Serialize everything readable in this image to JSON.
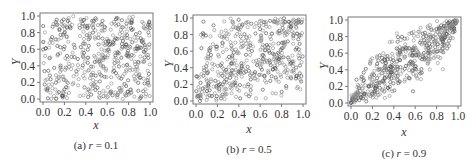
{
  "figure": {
    "panels": [
      {
        "id": "a",
        "caption_prefix": "(a) ",
        "caption_var": "r",
        "caption_eq": " = 0.1"
      },
      {
        "id": "b",
        "caption_prefix": "(b) ",
        "caption_var": "r",
        "caption_eq": " = 0.5"
      },
      {
        "id": "c",
        "caption_prefix": "(c) ",
        "caption_var": "r",
        "caption_eq": " = 0.9"
      }
    ]
  },
  "chart_data": [
    {
      "type": "scatter",
      "title": "(a) r = 0.1",
      "xlabel": "x",
      "ylabel": "Y",
      "xlim": [
        0.0,
        1.0
      ],
      "ylim": [
        0.0,
        1.0
      ],
      "xticks": [
        "0.0",
        "0.2",
        "0.4",
        "0.6",
        "0.8",
        "1.0"
      ],
      "yticks": [
        "0.0",
        "0.2",
        "0.4",
        "0.6",
        "0.8",
        "1.0"
      ],
      "grid": false,
      "marker": "open-circle",
      "correlation": 0.1,
      "n_points_approx": 500,
      "description": "Points spread roughly uniformly over the unit square; no visible trend"
    },
    {
      "type": "scatter",
      "title": "(b) r = 0.5",
      "xlabel": "x",
      "ylabel": "Y",
      "xlim": [
        0.0,
        1.0
      ],
      "ylim": [
        0.0,
        1.0
      ],
      "xticks": [
        "0.0",
        "0.2",
        "0.4",
        "0.6",
        "0.8",
        "1.0"
      ],
      "yticks": [
        "0.0",
        "0.2",
        "0.4",
        "0.6",
        "0.8",
        "1.0"
      ],
      "grid": false,
      "marker": "open-circle",
      "correlation": 0.5,
      "n_points_approx": 500,
      "description": "Moderate positive association; dense cluster near (0.1, 0.05) and near (0.95, 0.95)"
    },
    {
      "type": "scatter",
      "title": "(c) r = 0.9",
      "xlabel": "x",
      "ylabel": "Y",
      "xlim": [
        0.0,
        1.0
      ],
      "ylim": [
        0.0,
        1.0
      ],
      "xticks": [
        "0.0",
        "0.2",
        "0.4",
        "0.6",
        "0.8",
        "1.0"
      ],
      "yticks": [
        "0.0",
        "0.2",
        "0.4",
        "0.6",
        "0.8",
        "1.0"
      ],
      "grid": false,
      "marker": "open-circle",
      "correlation": 0.9,
      "n_points_approx": 500,
      "description": "Strong positive association; points concentrated along the diagonal y = x from (0,0) to (1,1)"
    }
  ]
}
